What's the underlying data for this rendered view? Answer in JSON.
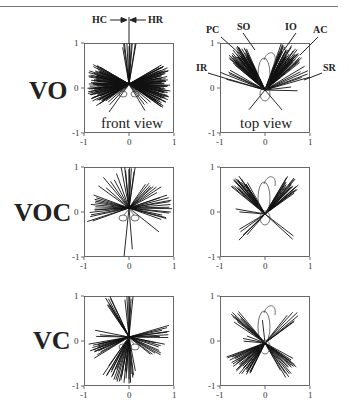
{
  "figure": {
    "rows": [
      {
        "label": "VO"
      },
      {
        "label": "VOC"
      },
      {
        "label": "VC"
      }
    ],
    "view_labels": {
      "front": "front view",
      "top": "top view"
    },
    "front_annotations": {
      "left": "HC",
      "right": "HR"
    },
    "top_annotations": {
      "PC": "PC",
      "SO": "SO",
      "IO": "IO",
      "AC": "AC",
      "IR": "IR",
      "SR": "SR"
    },
    "axis_ticks": {
      "y_top": "1",
      "y_mid": "0",
      "y_bottom": "-1",
      "x_left": "-1",
      "x_mid": "0",
      "x_right": "1"
    },
    "line_color": "#111111"
  },
  "chart_data": [
    {
      "type": "scatter",
      "title": "VO front view",
      "xlim": [
        -1,
        1
      ],
      "ylim": [
        -1,
        1
      ],
      "xticks": [
        -1,
        0,
        1
      ],
      "yticks": [
        -1,
        0,
        1
      ],
      "rays": {
        "mode": "fan",
        "segments": [
          [
            150,
            215,
            70,
            0.85
          ],
          [
            -35,
            30,
            70,
            0.85
          ],
          [
            80,
            100,
            10,
            1.0
          ],
          [
            215,
            235,
            4,
            0.7
          ],
          [
            -60,
            -40,
            4,
            0.7
          ]
        ]
      },
      "annotations": [
        "HC",
        "HR",
        "front view"
      ]
    },
    {
      "type": "scatter",
      "title": "VO top view",
      "xlim": [
        -1,
        1
      ],
      "ylim": [
        -1,
        1
      ],
      "xticks": [
        -1,
        0,
        1
      ],
      "yticks": [
        -1,
        0,
        1
      ],
      "rays": {
        "mode": "fan",
        "segments": [
          [
            115,
            140,
            45,
            1.05
          ],
          [
            40,
            70,
            45,
            1.05
          ],
          [
            150,
            165,
            6,
            1.0
          ],
          [
            15,
            30,
            6,
            1.0
          ],
          [
            225,
            235,
            1,
            0.55
          ],
          [
            -55,
            -45,
            1,
            0.6
          ],
          [
            0,
            5,
            2,
            0.7
          ]
        ]
      },
      "annotations": [
        "PC",
        "SO",
        "IO",
        "AC",
        "IR",
        "SR",
        "top view"
      ]
    },
    {
      "type": "scatter",
      "title": "VOC front view",
      "xlim": [
        -1,
        1
      ],
      "ylim": [
        -1,
        1
      ],
      "xticks": [
        -1,
        0,
        1
      ],
      "yticks": [
        -1,
        0,
        1
      ],
      "rays": {
        "mode": "fan",
        "segments": [
          [
            160,
            200,
            14,
            0.9
          ],
          [
            -20,
            20,
            14,
            0.9
          ],
          [
            80,
            100,
            8,
            1.0
          ],
          [
            110,
            145,
            6,
            0.85
          ],
          [
            30,
            55,
            8,
            0.8
          ],
          [
            265,
            275,
            2,
            1.0
          ],
          [
            -40,
            -38,
            1,
            0.8
          ]
        ]
      },
      "annotations": []
    },
    {
      "type": "scatter",
      "title": "VOC top view",
      "xlim": [
        -1,
        1
      ],
      "ylim": [
        -1,
        1
      ],
      "xticks": [
        -1,
        0,
        1
      ],
      "yticks": [
        -1,
        0,
        1
      ],
      "rays": {
        "mode": "fan",
        "segments": [
          [
            120,
            140,
            22,
            0.95
          ],
          [
            35,
            60,
            22,
            0.95
          ],
          [
            170,
            176,
            2,
            0.7
          ],
          [
            210,
            230,
            4,
            0.7
          ],
          [
            -42,
            -38,
            2,
            0.95
          ],
          [
            225,
            228,
            1,
            0.95
          ]
        ]
      },
      "annotations": []
    },
    {
      "type": "scatter",
      "title": "VC front view",
      "xlim": [
        -1,
        1
      ],
      "ylim": [
        -1,
        1
      ],
      "xticks": [
        -1,
        0,
        1
      ],
      "yticks": [
        -1,
        0,
        1
      ],
      "rays": {
        "mode": "fan",
        "segments": [
          [
            85,
            95,
            6,
            1.0
          ],
          [
            115,
            125,
            8,
            0.95
          ],
          [
            190,
            210,
            14,
            0.85
          ],
          [
            235,
            280,
            26,
            0.95
          ],
          [
            -40,
            -10,
            10,
            0.75
          ],
          [
            0,
            15,
            8,
            0.85
          ],
          [
            170,
            180,
            3,
            0.75
          ]
        ]
      },
      "annotations": []
    },
    {
      "type": "scatter",
      "title": "VC top view",
      "xlim": [
        -1,
        1
      ],
      "ylim": [
        -1,
        1
      ],
      "xticks": [
        -1,
        0,
        1
      ],
      "yticks": [
        -1,
        0,
        1
      ],
      "rays": {
        "mode": "fan",
        "segments": [
          [
            130,
            145,
            10,
            0.95
          ],
          [
            35,
            50,
            6,
            0.95
          ],
          [
            200,
            245,
            30,
            0.85
          ],
          [
            -60,
            -30,
            16,
            0.85
          ],
          [
            160,
            175,
            3,
            0.5
          ],
          [
            95,
            100,
            1,
            0.6
          ]
        ]
      },
      "annotations": []
    }
  ]
}
